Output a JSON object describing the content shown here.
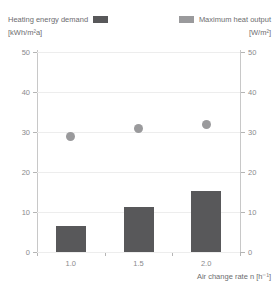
{
  "legend": {
    "left": {
      "label": "Heating energy demand",
      "unit": "[kWh/m²a]",
      "color": "#58585a",
      "swatch_icon": "filled-rect-icon"
    },
    "right": {
      "label": "Maximum heat output",
      "unit": "[W/m²]",
      "color": "#9a9a9c",
      "swatch_icon": "filled-rect-icon"
    }
  },
  "axes": {
    "y_left_ticks": [
      "0",
      "10",
      "20",
      "30",
      "40",
      "50"
    ],
    "y_right_ticks": [
      "0",
      "10",
      "20",
      "30",
      "40",
      "50"
    ],
    "x_ticks": [
      "1.0",
      "1.5",
      "2.0"
    ],
    "x_title": "Air change rate n [h⁻¹]"
  },
  "chart_data": {
    "type": "bar",
    "title": "",
    "subtitle": "",
    "xlabel": "Air change rate n [h⁻¹]",
    "ylabel": "[kWh/m²a]",
    "y2label": "[W/m²]",
    "categories": [
      "1.0",
      "1.5",
      "2.0"
    ],
    "ylim": [
      0,
      50
    ],
    "y2lim": [
      0,
      50
    ],
    "yticks": [
      0,
      10,
      20,
      30,
      40,
      50
    ],
    "y2ticks": [
      0,
      10,
      20,
      30,
      40,
      50
    ],
    "grid": "horizontal",
    "legend_position": "top",
    "series": [
      {
        "name": "Heating energy demand",
        "unit": "kWh/m²a",
        "type": "bar",
        "axis": "left",
        "color": "#58585a",
        "values": [
          6.5,
          11.2,
          15.2
        ]
      },
      {
        "name": "Maximum heat output",
        "unit": "W/m²",
        "type": "scatter",
        "axis": "right",
        "color": "#9a9a9c",
        "values": [
          29.0,
          31.0,
          31.8
        ]
      }
    ]
  }
}
